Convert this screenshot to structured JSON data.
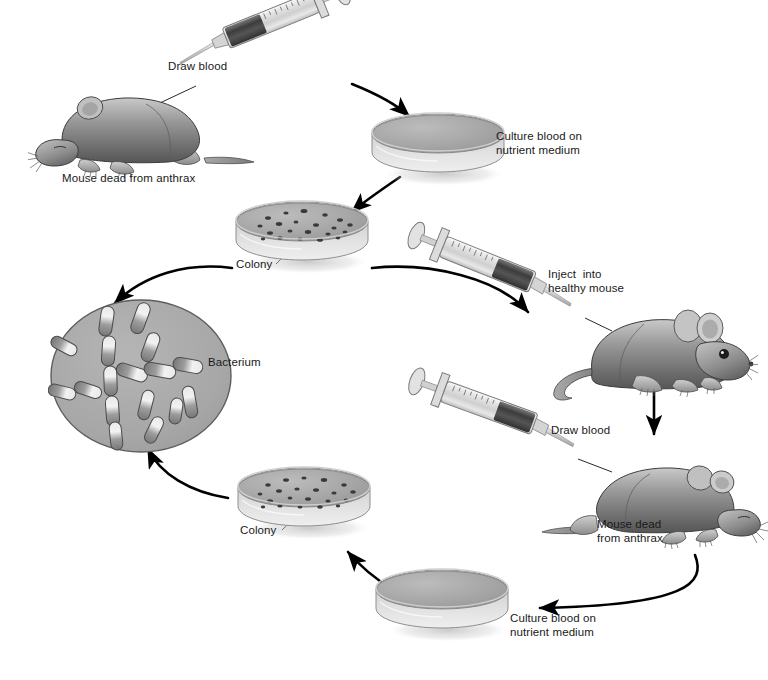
{
  "diagram": {
    "type": "cyclic-process-diagram",
    "background": "#ffffff",
    "ink": "#1a1a1a"
  },
  "labels": {
    "draw_blood_top": "Draw blood",
    "mouse_dead_top": "Mouse dead from anthrax",
    "culture_top_line1": "Culture blood on",
    "culture_top_line2": "nutrient medium",
    "colony_top": "Colony",
    "bacterium": "Bacterium",
    "inject_line1": "Inject  into",
    "inject_line2": "healthy mouse",
    "draw_blood_bottom": "Draw blood",
    "mouse_dead_bottom_line1": "Mouse dead",
    "mouse_dead_bottom_line2": "from anthrax",
    "culture_bottom_line1": "Culture blood on",
    "culture_bottom_line2": "nutrient medium",
    "colony_bottom": "Colony"
  },
  "steps": [
    {
      "id": "mouse-dead-top",
      "label": "Mouse dead from anthrax",
      "kind": "mouse-dead"
    },
    {
      "id": "draw-blood-top",
      "label": "Draw blood",
      "kind": "syringe"
    },
    {
      "id": "culture-top",
      "label": "Culture blood on nutrient medium",
      "kind": "petri-plain"
    },
    {
      "id": "colony-top",
      "label": "Colony",
      "kind": "petri-colonies"
    },
    {
      "id": "bacterium",
      "label": "Bacterium",
      "kind": "micrograph"
    },
    {
      "id": "inject",
      "label": "Inject into healthy mouse",
      "kind": "syringe"
    },
    {
      "id": "mouse-healthy",
      "label": "healthy mouse",
      "kind": "mouse-alive"
    },
    {
      "id": "mouse-dead-bottom",
      "label": "Mouse dead from anthrax",
      "kind": "mouse-dead"
    },
    {
      "id": "draw-blood-bottom",
      "label": "Draw blood",
      "kind": "syringe"
    },
    {
      "id": "culture-bottom",
      "label": "Culture blood on nutrient medium",
      "kind": "petri-plain"
    },
    {
      "id": "colony-bottom",
      "label": "Colony",
      "kind": "petri-colonies"
    }
  ],
  "colors": {
    "petri_medium": "#a7a7a7",
    "petri_glass": "#dcdcdc",
    "micrograph_field": "#a9a9a9",
    "mouse_body": "#8e8e8e",
    "arrow": "#000000"
  }
}
